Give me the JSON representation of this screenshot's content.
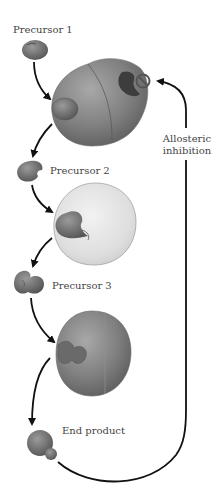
{
  "diagram": {
    "type": "feedback inhibition pathway",
    "labels": {
      "precursor1": "Precursor 1",
      "precursor2": "Precursor 2",
      "precursor3": "Precursor 3",
      "end_product": "End product",
      "allosteric_line1": "Allosteric",
      "allosteric_line2": "inhibition"
    },
    "nodes": [
      {
        "id": "precursor1",
        "kind": "molecule",
        "label": "Precursor 1"
      },
      {
        "id": "enzyme1",
        "kind": "enzyme",
        "state": "inhibited (allosteric site bound)"
      },
      {
        "id": "precursor2",
        "kind": "molecule",
        "label": "Precursor 2"
      },
      {
        "id": "enzyme2",
        "kind": "enzyme"
      },
      {
        "id": "precursor3",
        "kind": "molecule",
        "label": "Precursor 3"
      },
      {
        "id": "enzyme3",
        "kind": "enzyme"
      },
      {
        "id": "end_product",
        "kind": "molecule",
        "label": "End product"
      }
    ],
    "edges": [
      {
        "from": "precursor1",
        "to": "enzyme1"
      },
      {
        "from": "enzyme1",
        "to": "precursor2"
      },
      {
        "from": "precursor2",
        "to": "enzyme2"
      },
      {
        "from": "enzyme2",
        "to": "precursor3"
      },
      {
        "from": "precursor3",
        "to": "enzyme3"
      },
      {
        "from": "enzyme3",
        "to": "end_product"
      },
      {
        "from": "end_product",
        "to": "enzyme1",
        "label": "Allosteric inhibition",
        "kind": "feedback"
      }
    ],
    "icons": {
      "inhibition": "prohibited-sign-icon"
    },
    "colors": {
      "enzyme_dark": "#7d7d7d",
      "enzyme_light": "#dedede",
      "molecule": "#6e6e6e",
      "arrow": "#111111",
      "text": "#444444"
    }
  }
}
